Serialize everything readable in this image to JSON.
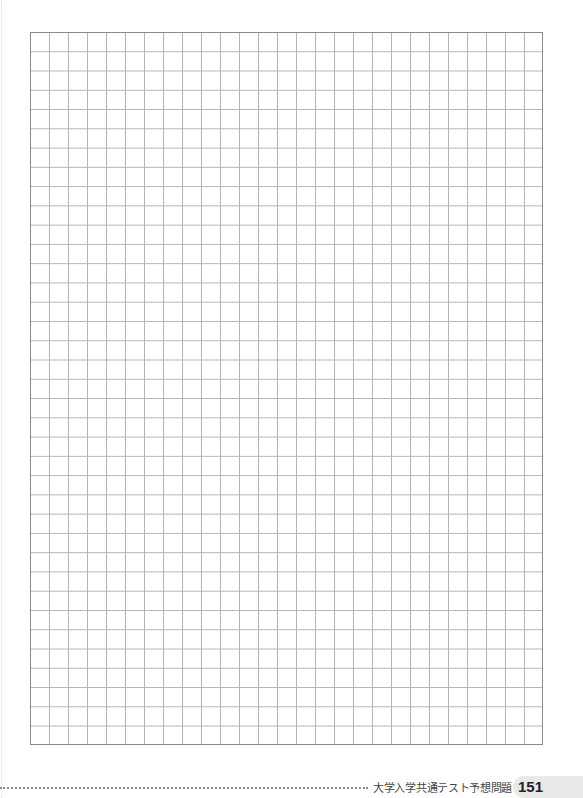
{
  "page": {
    "type": "answer-grid-sheet",
    "grid": {
      "columns": 27,
      "rows": 37,
      "border_color": "#8a8a8a",
      "line_color": "#b4b4b4"
    }
  },
  "footer": {
    "title": "大学入学共通テスト予想問題 2",
    "page_number": "151",
    "badge_color": "#e9e9e9"
  }
}
